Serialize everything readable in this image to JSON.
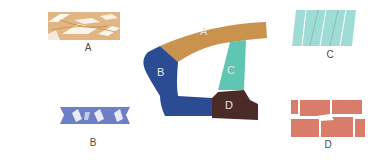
{
  "diagram": {
    "title": "",
    "colors": {
      "a": "#c9924d",
      "a_light": "#e2b684",
      "b": "#2b4c93",
      "b_light": "#6c7fc7",
      "c": "#5ec6b3",
      "c_light": "#9fdcd6",
      "d": "#4a2b28",
      "d_light": "#d97d6a"
    },
    "center_figure": {
      "regions": [
        {
          "id": "A",
          "label": "A"
        },
        {
          "id": "B",
          "label": "B"
        },
        {
          "id": "C",
          "label": "C"
        },
        {
          "id": "D",
          "label": "D"
        }
      ]
    },
    "panels": [
      {
        "id": "A",
        "label": "A",
        "position": "top-left",
        "pattern": "interlaced weave"
      },
      {
        "id": "B",
        "label": "B",
        "position": "bottom-left",
        "pattern": "interlocking zigzag blocks"
      },
      {
        "id": "C",
        "label": "C",
        "position": "top-right",
        "pattern": "slanted parallel bands"
      },
      {
        "id": "D",
        "label": "D",
        "position": "bottom-right",
        "pattern": "brick-like blocks"
      }
    ]
  }
}
